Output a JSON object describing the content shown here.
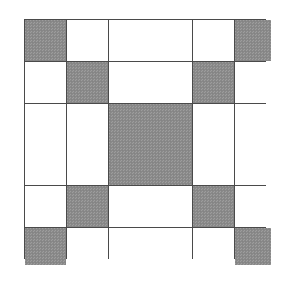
{
  "figure": {
    "background_color": "#ffffff"
  },
  "colors": {
    "fill_gray": "#8b8b8b",
    "fill_white": "#ffffff",
    "grid_line": "#4a4a4a",
    "page_background": "#ffffff"
  },
  "chart_data": {
    "type": "heatmap",
    "title": "",
    "xlabel": "",
    "ylabel": "",
    "grid": true,
    "legend": "none",
    "rows": 5,
    "cols": 5,
    "col_widths": [
      41,
      41,
      83,
      41,
      36
    ],
    "row_heights": [
      41,
      41,
      81,
      41,
      37
    ],
    "categories": [
      "c1",
      "c2",
      "c3",
      "c4",
      "c5"
    ],
    "row_labels": [
      "r1",
      "r2",
      "r3",
      "r4",
      "r5"
    ],
    "value_legend": {
      "0": "white",
      "1": "gray"
    },
    "values": [
      [
        1,
        0,
        0,
        0,
        1
      ],
      [
        0,
        1,
        0,
        1,
        0
      ],
      [
        0,
        0,
        1,
        0,
        0
      ],
      [
        0,
        1,
        0,
        1,
        0
      ],
      [
        1,
        0,
        0,
        0,
        1
      ]
    ],
    "cells": [
      {
        "row": 0,
        "col": 0,
        "fill": "gray"
      },
      {
        "row": 0,
        "col": 1,
        "fill": "white"
      },
      {
        "row": 0,
        "col": 2,
        "fill": "white"
      },
      {
        "row": 0,
        "col": 3,
        "fill": "white"
      },
      {
        "row": 0,
        "col": 4,
        "fill": "gray"
      },
      {
        "row": 1,
        "col": 0,
        "fill": "white"
      },
      {
        "row": 1,
        "col": 1,
        "fill": "gray"
      },
      {
        "row": 1,
        "col": 2,
        "fill": "white"
      },
      {
        "row": 1,
        "col": 3,
        "fill": "gray"
      },
      {
        "row": 1,
        "col": 4,
        "fill": "white"
      },
      {
        "row": 2,
        "col": 0,
        "fill": "white"
      },
      {
        "row": 2,
        "col": 1,
        "fill": "white"
      },
      {
        "row": 2,
        "col": 2,
        "fill": "gray"
      },
      {
        "row": 2,
        "col": 3,
        "fill": "white"
      },
      {
        "row": 2,
        "col": 4,
        "fill": "white"
      },
      {
        "row": 3,
        "col": 0,
        "fill": "white"
      },
      {
        "row": 3,
        "col": 1,
        "fill": "gray"
      },
      {
        "row": 3,
        "col": 2,
        "fill": "white"
      },
      {
        "row": 3,
        "col": 3,
        "fill": "gray"
      },
      {
        "row": 3,
        "col": 4,
        "fill": "white"
      },
      {
        "row": 4,
        "col": 0,
        "fill": "gray"
      },
      {
        "row": 4,
        "col": 1,
        "fill": "white"
      },
      {
        "row": 4,
        "col": 2,
        "fill": "white"
      },
      {
        "row": 4,
        "col": 3,
        "fill": "white"
      },
      {
        "row": 4,
        "col": 4,
        "fill": "gray"
      }
    ],
    "counts": {
      "gray": 9,
      "white": 16,
      "total": 25
    }
  }
}
